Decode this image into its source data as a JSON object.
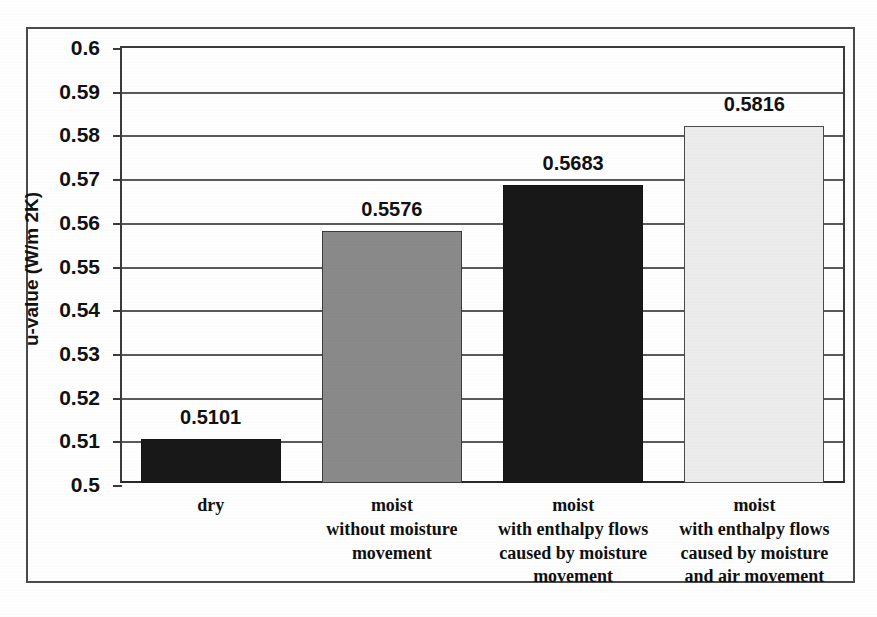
{
  "chart_data": {
    "type": "bar",
    "title": "",
    "subtitle": "",
    "xlabel": "",
    "ylabel": "u-value (W/m 2K)",
    "ylim": [
      0.5,
      0.6
    ],
    "ytick_step": 0.01,
    "grid": true,
    "legend": "none",
    "categories": [
      "dry",
      "moist without moisture movement",
      "moist with enthalpy flows caused by moisture movement",
      "moist with enthalpy flows caused by moisture and air movement"
    ],
    "category_lines": [
      [
        "dry"
      ],
      [
        "moist",
        "without moisture",
        "movement"
      ],
      [
        "moist",
        "with enthalpy flows",
        "caused by moisture",
        "movement"
      ],
      [
        "moist",
        "with enthalpy flows",
        "caused by moisture",
        "and air movement"
      ]
    ],
    "values": [
      0.5101,
      0.5576,
      0.5683,
      0.5816
    ],
    "value_labels": [
      "0.5101",
      "0.5576",
      "0.5683",
      "0.5816"
    ],
    "bar_colors": [
      "#181818",
      "#8a8a8a",
      "#181818",
      "#ececec"
    ],
    "ytick_labels": [
      "0.6",
      "0.59",
      "0.58",
      "0.57",
      "0.56",
      "0.55",
      "0.54",
      "0.53",
      "0.52",
      "0.51",
      "0.5"
    ],
    "ytick_values": [
      0.6,
      0.59,
      0.58,
      0.57,
      0.56,
      0.55,
      0.54,
      0.53,
      0.52,
      0.51,
      0.5
    ]
  },
  "figure": {
    "frame_color": "#4a4a4a",
    "axis_color": "#3b3b3b",
    "text_color": "#111111"
  }
}
